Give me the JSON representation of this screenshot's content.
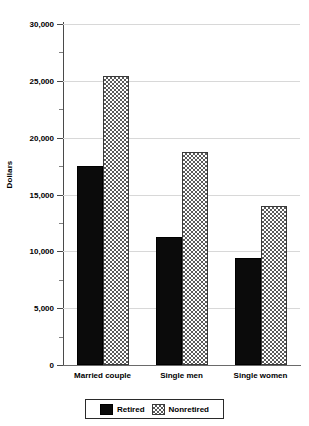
{
  "chart_data": {
    "type": "bar",
    "title": "",
    "subtitle": "",
    "xlabel": "",
    "ylabel": "Dollars",
    "categories": [
      "Married couple",
      "Single men",
      "Single women"
    ],
    "series": [
      {
        "name": "Retired",
        "values": [
          17500,
          11300,
          9400
        ],
        "fill": "solid-black",
        "color": "#0b0b0b"
      },
      {
        "name": "Nonretired",
        "values": [
          25400,
          18700,
          14000
        ],
        "fill": "checkerboard",
        "color": "#5a5a5a"
      }
    ],
    "ylim": [
      0,
      30000
    ],
    "ytick_values": [
      0,
      5000,
      10000,
      15000,
      20000,
      25000,
      30000
    ],
    "ytick_labels": [
      "0",
      "5,000",
      "10,000",
      "15,000",
      "20,000",
      "25,000",
      "30,000"
    ],
    "yminor_tick_values": [
      2500,
      7500,
      12500,
      17500,
      22500,
      27500
    ],
    "grid": true,
    "grid_axis": "y",
    "legend_position": "bottom",
    "legend_entries": [
      "Retired",
      "Nonretired"
    ]
  },
  "axis": {
    "y_title": "Dollars"
  },
  "legend": {
    "retired_label": "Retired",
    "nonretired_label": "Nonretired"
  }
}
